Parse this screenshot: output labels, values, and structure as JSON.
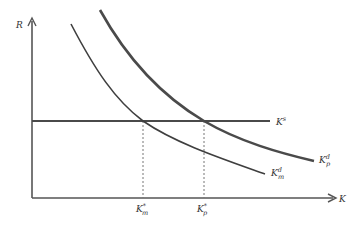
{
  "diagram": {
    "type": "supply-demand",
    "axes": {
      "y_label": "R",
      "x_label": "K"
    },
    "curves": [
      {
        "name": "Kp_demand",
        "label_base": "K",
        "label_sub": "p",
        "label_sup": "d"
      },
      {
        "name": "Km_demand",
        "label_base": "K",
        "label_sub": "m",
        "label_sup": "d"
      },
      {
        "name": "supply",
        "label_base": "K",
        "label_sup": "s"
      }
    ],
    "equilibria": [
      {
        "label_base": "K",
        "label_sub": "m",
        "label_sup": "*"
      },
      {
        "label_base": "K",
        "label_sub": "p",
        "label_sup": "*"
      }
    ],
    "colors": {
      "line": "#4a4a4a",
      "axis": "#555555",
      "dashed": "#777777"
    }
  }
}
